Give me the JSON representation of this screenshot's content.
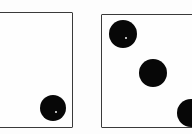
{
  "scene": {
    "title": "Two dice",
    "width": 192,
    "height": 134,
    "background_color": "#fdfdfd",
    "pip_color": "#070707",
    "border_color": "#3a3a3a",
    "description": "Two white dice photographed on a white surface; left die shows one pip, right die shows three pips."
  },
  "dice": [
    {
      "name": "left-die",
      "face_value": "1",
      "value_label": "1",
      "clipped_edge": "left",
      "box": {
        "left": -14,
        "top": 12,
        "width": 87,
        "height": 116
      },
      "pips": [
        {
          "name": "pip-bottom-right",
          "cx": 66,
          "cy": 95,
          "r": 13,
          "highlight": true
        }
      ]
    },
    {
      "name": "right-die",
      "face_value": "3",
      "value_label": "3",
      "clipped_edge": "right",
      "box": {
        "left": 101,
        "top": 14,
        "width": 104,
        "height": 114
      },
      "pips": [
        {
          "name": "pip-top-left",
          "cx": 21,
          "cy": 19,
          "r": 14,
          "highlight": true
        },
        {
          "name": "pip-center",
          "cx": 51,
          "cy": 58,
          "r": 14,
          "highlight": false
        },
        {
          "name": "pip-bottom-right",
          "cx": 89,
          "cy": 98,
          "r": 14,
          "highlight": false
        }
      ]
    }
  ],
  "totals": {
    "sum_label": "4"
  }
}
